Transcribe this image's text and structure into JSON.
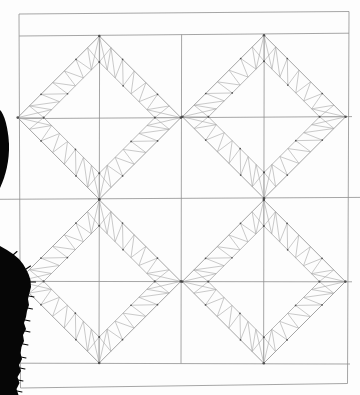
{
  "scene": {
    "kind": "pencil drawing of a 2x2 sawtooth-diamond quilt pattern on paper, photographed with a black object intruding along the left edge",
    "canvas": {
      "width": 360,
      "height": 395
    },
    "colors": {
      "paper": "#fdfdfd",
      "grid_line": "#8f8f8f",
      "diamond_edge": "#8d8d8d",
      "inner_edge": "#999999",
      "tooth_line": "#a6a6a6",
      "dot": "#3f3f3f",
      "occlusion": "#060606"
    },
    "grid_lines": [
      {
        "name": "page-border-top",
        "x1": 19,
        "y1": 14,
        "x2": 349,
        "y2": 11.5
      },
      {
        "name": "page-border-right",
        "x1": 349,
        "y1": 11.5,
        "x2": 347.5,
        "y2": 383.5
      },
      {
        "name": "page-border-bottom",
        "x1": 20.5,
        "y1": 388,
        "x2": 347.5,
        "y2": 383.5
      },
      {
        "name": "page-border-left",
        "x1": 19,
        "y1": 14,
        "x2": 20.5,
        "y2": 388
      },
      {
        "name": "sashing-line-top",
        "x1": 19.2,
        "y1": 36,
        "x2": 349,
        "y2": 33.2
      },
      {
        "name": "sashing-line-bottom",
        "x1": 20.4,
        "y1": 363.2,
        "x2": 350,
        "y2": 364
      },
      {
        "name": "row-divider-line",
        "x1": 0,
        "y1": 199.3,
        "x2": 360,
        "y2": 197.4
      },
      {
        "name": "column-divider-line",
        "x1": 181.6,
        "y1": 34.6,
        "x2": 181,
        "y2": 363.4
      },
      {
        "name": "block-axis-h-top",
        "x1": 19.2,
        "y1": 118.6,
        "x2": 352,
        "y2": 116.6
      },
      {
        "name": "block-axis-h-bottom",
        "x1": 20.2,
        "y1": 281.4,
        "x2": 352,
        "y2": 281.8
      },
      {
        "name": "block-axis-v-left",
        "x1": 99.6,
        "y1": 35.2,
        "x2": 99,
        "y2": 363.3
      },
      {
        "name": "block-axis-v-right",
        "x1": 264.2,
        "y1": 34.4,
        "x2": 263.6,
        "y2": 363.6
      }
    ],
    "diamond": {
      "half_diagonal": 81.6,
      "inner_half_diagonal": 55.6,
      "teeth_per_side": 7,
      "corner_dot_radius": 1.3,
      "inner_dot_radius": 1.05,
      "tooth_dot_radius": 0.85
    },
    "blocks": [
      {
        "name": "block-top-left",
        "cx": 99.3,
        "cy": 117.6
      },
      {
        "name": "block-top-right",
        "cx": 264,
        "cy": 116.8
      },
      {
        "name": "block-bottom-left",
        "cx": 99.2,
        "cy": 281.4
      },
      {
        "name": "block-bottom-right",
        "cx": 263.8,
        "cy": 281.6
      }
    ],
    "occlusions": {
      "small_blob_path": "M0,110 C4,114 8,126 9,144 C9.5,160 6,175 0,188 Z",
      "large_blob_points": [
        [
          0,
          246
        ],
        [
          7,
          250
        ],
        [
          13,
          254
        ],
        [
          19,
          259
        ],
        [
          23,
          264
        ],
        [
          26,
          269
        ],
        [
          28.5,
          274
        ],
        [
          30.5,
          280
        ],
        [
          31,
          287
        ],
        [
          29.5,
          293
        ],
        [
          28,
          299
        ],
        [
          29,
          305
        ],
        [
          27,
          311
        ],
        [
          26,
          317
        ],
        [
          24,
          323
        ],
        [
          26,
          329
        ],
        [
          23,
          335
        ],
        [
          24,
          341
        ],
        [
          21.5,
          347
        ],
        [
          20.5,
          353
        ],
        [
          22,
          359
        ],
        [
          19,
          365
        ],
        [
          21,
          371
        ],
        [
          17.5,
          377
        ],
        [
          19.5,
          383
        ],
        [
          16.5,
          389
        ],
        [
          18.5,
          395
        ],
        [
          0,
          395
        ]
      ],
      "hairs": [
        [
          26,
          269,
          30.5,
          266
        ],
        [
          30.5,
          282,
          35.5,
          282
        ],
        [
          29,
          296,
          34,
          297
        ],
        [
          27.5,
          308,
          32.5,
          309
        ],
        [
          25,
          320,
          30,
          321
        ],
        [
          25,
          331,
          30,
          332
        ],
        [
          23,
          344,
          28,
          345
        ],
        [
          21,
          357,
          26,
          358
        ],
        [
          20,
          368,
          25,
          369
        ],
        [
          18,
          380,
          23,
          381
        ],
        [
          17,
          391,
          22,
          392
        ],
        [
          13,
          255,
          17,
          251.5
        ]
      ]
    }
  }
}
